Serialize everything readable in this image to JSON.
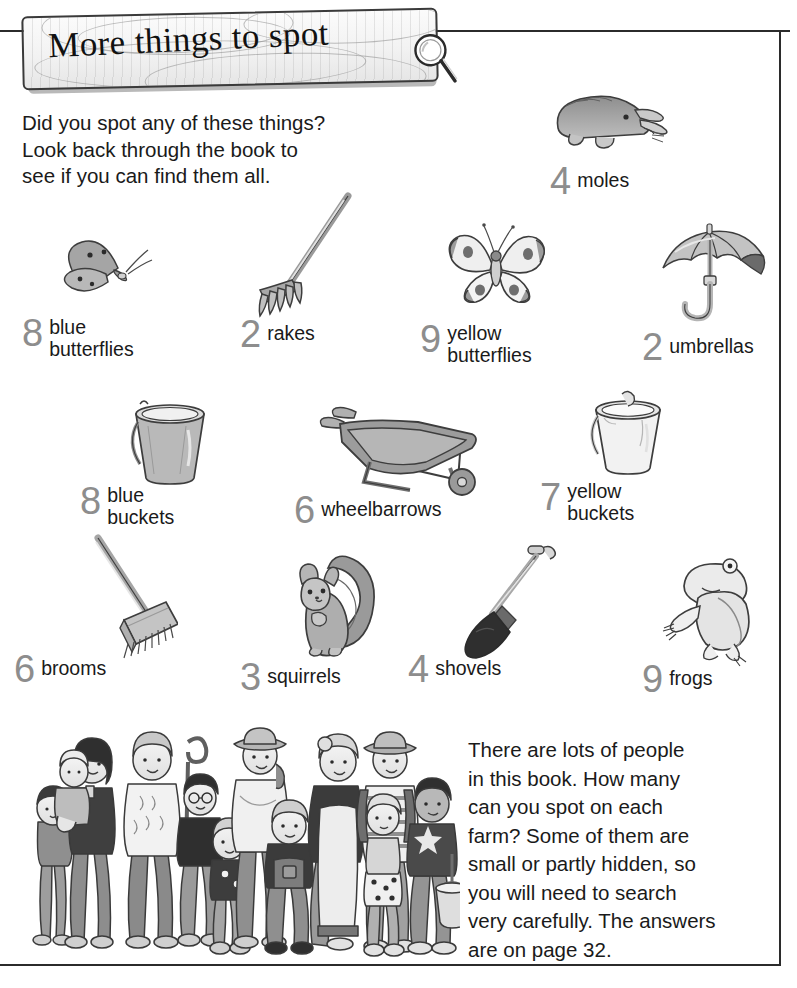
{
  "page": {
    "title": "More things to spot",
    "intro_lines": [
      "Did you spot any of these things?",
      "Look back through the book to",
      "see if you can find them all."
    ],
    "outro_lines": [
      "There are lots of people",
      "in this book. How many",
      "can you spot on each",
      "farm? Some of them are",
      "small or partly hidden, so",
      "you will need to search",
      "very carefully. The answers",
      "are on page 32."
    ],
    "answer_page": "32"
  },
  "colors": {
    "number_gray": "#8d8d8d",
    "text_black": "#1a1a1a",
    "frame": "#2b2b2b",
    "sign_wood": "#f2f2f2"
  },
  "icons": {
    "magnifier": "magnifying-glass-icon",
    "sign": "wooden-sign"
  },
  "items": [
    {
      "count": "4",
      "label_line1": "moles",
      "label_line2": "",
      "art": "mole-illustration"
    },
    {
      "count": "8",
      "label_line1": "blue",
      "label_line2": "butterflies",
      "art": "blue-butterfly-illustration"
    },
    {
      "count": "2",
      "label_line1": "rakes",
      "label_line2": "",
      "art": "rake-illustration"
    },
    {
      "count": "9",
      "label_line1": "yellow",
      "label_line2": "butterflies",
      "art": "yellow-butterfly-illustration"
    },
    {
      "count": "2",
      "label_line1": "umbrellas",
      "label_line2": "",
      "art": "umbrella-illustration"
    },
    {
      "count": "8",
      "label_line1": "blue",
      "label_line2": "buckets",
      "art": "blue-bucket-illustration"
    },
    {
      "count": "6",
      "label_line1": "wheelbarrows",
      "label_line2": "",
      "art": "wheelbarrow-illustration"
    },
    {
      "count": "7",
      "label_line1": "yellow",
      "label_line2": "buckets",
      "art": "yellow-bucket-illustration"
    },
    {
      "count": "6",
      "label_line1": "brooms",
      "label_line2": "",
      "art": "broom-illustration"
    },
    {
      "count": "3",
      "label_line1": "squirrels",
      "label_line2": "",
      "art": "squirrel-illustration"
    },
    {
      "count": "4",
      "label_line1": "shovels",
      "label_line2": "",
      "art": "shovel-illustration"
    },
    {
      "count": "9",
      "label_line1": "frogs",
      "label_line2": "",
      "art": "frog-illustration"
    }
  ],
  "people_illustration": "group-of-farm-people-illustration"
}
